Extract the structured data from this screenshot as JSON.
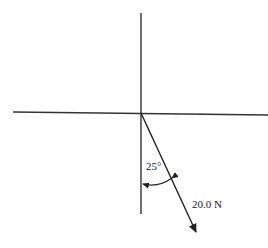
{
  "diagram": {
    "type": "force-vector",
    "axes": {
      "vertical": {
        "x": 141,
        "y1": 13,
        "y2": 214
      },
      "horizontal": {
        "y": 113,
        "x1": 13,
        "x2": 268
      },
      "color": "#333333"
    },
    "vector": {
      "magnitude_label": "20.0 N",
      "angle_label": "25°",
      "angle_reference": "from negative vertical axis",
      "tail": [
        141,
        113
      ],
      "tip": [
        197,
        233
      ],
      "color": "#222222"
    }
  }
}
